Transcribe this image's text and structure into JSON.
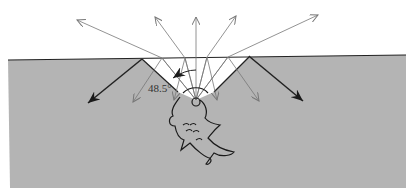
{
  "diagram": {
    "angle_label": "48.5°",
    "colors": {
      "water": "#b4b4b4",
      "air": "#ffffff",
      "surface_line": "#222222",
      "thin_ray": "#777777",
      "heavy_ray": "#222222",
      "fish_outline": "#1a1a1a"
    },
    "elements": {
      "surface": "water-air boundary",
      "cone": "critical-angle cone (white window)",
      "refracted_rays_count": 5,
      "internal_rays_count": 6,
      "reflected_heavy_rays_count": 2,
      "observer": "fish"
    }
  }
}
